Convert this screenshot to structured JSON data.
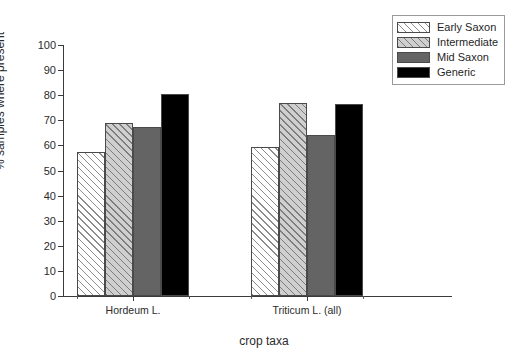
{
  "chart_data": {
    "type": "bar",
    "title": "",
    "xlabel": "crop taxa",
    "ylabel": "% samples where present",
    "categories": [
      "Hordeum L.",
      "Triticum L. (all)"
    ],
    "series": [
      {
        "name": "Early Saxon",
        "values": [
          57.5,
          59.5
        ],
        "style": "white-diagonal-hatch",
        "color": "#ffffff"
      },
      {
        "name": "Intermediate",
        "values": [
          69.0,
          77.0
        ],
        "style": "lightgray-diagonal-hatch",
        "color": "#cfcfcf"
      },
      {
        "name": "Mid Saxon",
        "values": [
          67.5,
          64.0
        ],
        "style": "solid",
        "color": "#646464"
      },
      {
        "name": "Generic",
        "values": [
          80.5,
          76.5
        ],
        "style": "solid",
        "color": "#000000"
      }
    ],
    "ylim": [
      0,
      100
    ],
    "ytick_labels": [
      "0",
      "10",
      "20",
      "30",
      "40",
      "50",
      "60",
      "70",
      "80",
      "90",
      "100"
    ],
    "ytick_values": [
      0,
      10,
      20,
      30,
      40,
      50,
      60,
      70,
      80,
      90,
      100
    ],
    "grid": false,
    "legend_position": "top-right",
    "background_color": "#ffffff",
    "axis_color": "#3a3a3a"
  }
}
